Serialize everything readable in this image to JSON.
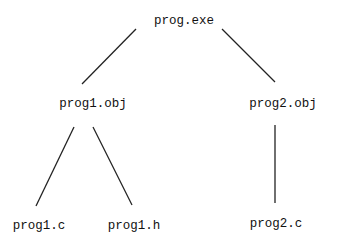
{
  "diagram": {
    "type": "tree",
    "nodes": [
      {
        "id": "root",
        "label": "prog.exe",
        "x": 184,
        "y": 21
      },
      {
        "id": "obj1",
        "label": "prog1.obj",
        "x": 93,
        "y": 104
      },
      {
        "id": "obj2",
        "label": "prog2.obj",
        "x": 283,
        "y": 104
      },
      {
        "id": "c1",
        "label": "prog1.c",
        "x": 39,
        "y": 226
      },
      {
        "id": "h1",
        "label": "prog1.h",
        "x": 134,
        "y": 226
      },
      {
        "id": "c2",
        "label": "prog2.c",
        "x": 276,
        "y": 224
      }
    ],
    "edges": [
      {
        "from": "root",
        "to": "obj1"
      },
      {
        "from": "root",
        "to": "obj2"
      },
      {
        "from": "obj1",
        "to": "c1"
      },
      {
        "from": "obj1",
        "to": "h1"
      },
      {
        "from": "obj2",
        "to": "c2"
      }
    ]
  }
}
